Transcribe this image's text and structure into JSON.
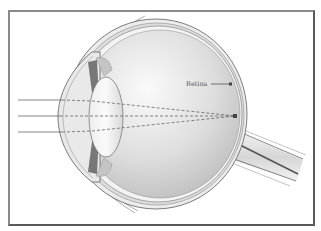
{
  "diagram": {
    "type": "eye-cross-section",
    "labels": {
      "retina": "Retina"
    },
    "rays": {
      "count": 3,
      "style_outside": "solid",
      "style_inside": "dashed",
      "converge_to": "retina-focal-point"
    },
    "colors": {
      "frame": "#5a5a5a",
      "outline": "#6e6e6e",
      "vitreous_light": "#f4f4f4",
      "vitreous_dark": "#bdbdbd",
      "nerve_center": "#555555",
      "ray": "#666666",
      "label_text": "#555555"
    }
  }
}
